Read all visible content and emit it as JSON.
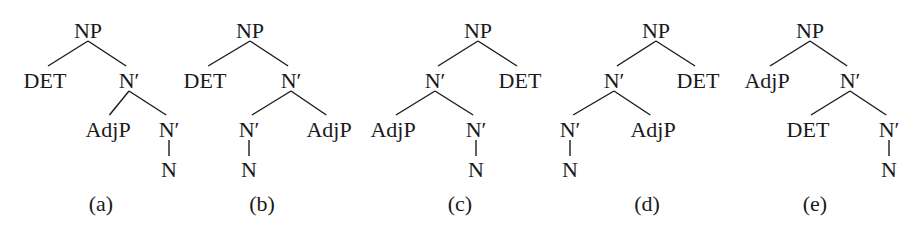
{
  "figure": {
    "trees": [
      {
        "id": "a",
        "caption": "(a)",
        "nodes": [
          {
            "id": "np",
            "label": "NP",
            "parent": null
          },
          {
            "id": "det",
            "label": "DET",
            "parent": "np"
          },
          {
            "id": "nbar1",
            "label": "N′",
            "parent": "np"
          },
          {
            "id": "adjp",
            "label": "AdjP",
            "parent": "nbar1"
          },
          {
            "id": "nbar2",
            "label": "N′",
            "parent": "nbar1"
          },
          {
            "id": "n",
            "label": "N",
            "parent": "nbar2"
          }
        ]
      },
      {
        "id": "b",
        "caption": "(b)",
        "nodes": [
          {
            "id": "np",
            "label": "NP",
            "parent": null
          },
          {
            "id": "det",
            "label": "DET",
            "parent": "np"
          },
          {
            "id": "nbar1",
            "label": "N′",
            "parent": "np"
          },
          {
            "id": "nbar2",
            "label": "N′",
            "parent": "nbar1"
          },
          {
            "id": "adjp",
            "label": "AdjP",
            "parent": "nbar1"
          },
          {
            "id": "n",
            "label": "N",
            "parent": "nbar2"
          }
        ]
      },
      {
        "id": "c",
        "caption": "(c)",
        "nodes": [
          {
            "id": "np",
            "label": "NP",
            "parent": null
          },
          {
            "id": "nbar1",
            "label": "N′",
            "parent": "np"
          },
          {
            "id": "det",
            "label": "DET",
            "parent": "np"
          },
          {
            "id": "adjp",
            "label": "AdjP",
            "parent": "nbar1"
          },
          {
            "id": "nbar2",
            "label": "N′",
            "parent": "nbar1"
          },
          {
            "id": "n",
            "label": "N",
            "parent": "nbar2"
          }
        ]
      },
      {
        "id": "d",
        "caption": "(d)",
        "nodes": [
          {
            "id": "np",
            "label": "NP",
            "parent": null
          },
          {
            "id": "nbar1",
            "label": "N′",
            "parent": "np"
          },
          {
            "id": "det",
            "label": "DET",
            "parent": "np"
          },
          {
            "id": "nbar2",
            "label": "N′",
            "parent": "nbar1"
          },
          {
            "id": "adjp",
            "label": "AdjP",
            "parent": "nbar1"
          },
          {
            "id": "n",
            "label": "N",
            "parent": "nbar2"
          }
        ]
      },
      {
        "id": "e",
        "caption": "(e)",
        "nodes": [
          {
            "id": "np",
            "label": "NP",
            "parent": null
          },
          {
            "id": "adjp",
            "label": "AdjP",
            "parent": "np"
          },
          {
            "id": "nbar1",
            "label": "N′",
            "parent": "np"
          },
          {
            "id": "det",
            "label": "DET",
            "parent": "nbar1"
          },
          {
            "id": "nbar2",
            "label": "N′",
            "parent": "nbar1"
          },
          {
            "id": "n",
            "label": "N",
            "parent": "nbar2"
          }
        ]
      }
    ]
  }
}
